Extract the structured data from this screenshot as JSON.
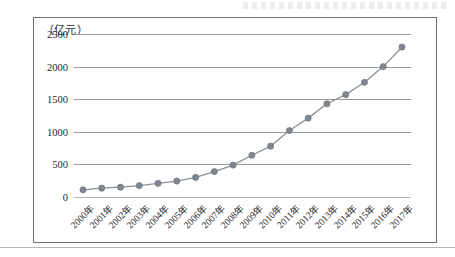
{
  "figure": {
    "unit_label": "（亿元）",
    "top_strip_note": ""
  },
  "chart_data": {
    "type": "line",
    "title": "",
    "xlabel": "",
    "ylabel": "亿元",
    "unit": "亿元",
    "ylim": [
      0,
      2500
    ],
    "yticks": [
      0,
      500,
      1000,
      1500,
      2000,
      2500
    ],
    "ytick_labels": [
      "0",
      "500",
      "1000",
      "1500",
      "2000",
      "2500"
    ],
    "grid": true,
    "legend": false,
    "marker": "circle",
    "line_color": "#8a8f96",
    "marker_color": "#7f868e",
    "categories": [
      "2000年",
      "2001年",
      "2002年",
      "2003年",
      "2004年",
      "2005年",
      "2006年",
      "2007年",
      "2008年",
      "2009年",
      "2010年",
      "2011年",
      "2012年",
      "2013年",
      "2014年",
      "2015年",
      "2016年",
      "2017年"
    ],
    "values": [
      110,
      135,
      150,
      175,
      210,
      245,
      300,
      390,
      490,
      640,
      780,
      1020,
      1210,
      1430,
      1570,
      1760,
      2000,
      2300
    ]
  }
}
